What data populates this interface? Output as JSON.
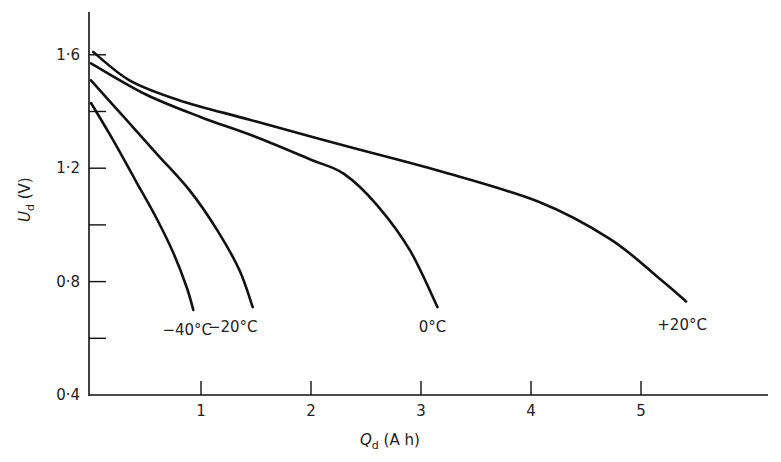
{
  "chart_data": {
    "type": "line",
    "title": "",
    "xlabel": "Q_d (A h)",
    "ylabel": "U_d (V)",
    "xlim": [
      0,
      6.2
    ],
    "ylim": [
      0.4,
      1.75
    ],
    "x_ticks": [
      1,
      2,
      3,
      4,
      5
    ],
    "x_tick_labels": [
      "1",
      "2",
      "3",
      "4",
      "5"
    ],
    "y_ticks": [
      0.4,
      0.6,
      0.8,
      1.0,
      1.2,
      1.4,
      1.6
    ],
    "y_tick_labels": [
      "0·4",
      "",
      "0·8",
      "",
      "1·2",
      "",
      "1·6"
    ],
    "grid": false,
    "legend": "inline labels at curve ends",
    "series": [
      {
        "name": "-40°C",
        "label": "−40°C",
        "points": [
          [
            0.0,
            1.43
          ],
          [
            0.2,
            1.3
          ],
          [
            0.4,
            1.16
          ],
          [
            0.6,
            1.02
          ],
          [
            0.75,
            0.9
          ],
          [
            0.87,
            0.78
          ],
          [
            0.93,
            0.7
          ]
        ]
      },
      {
        "name": "-20°C",
        "label": "−20°C",
        "points": [
          [
            0.0,
            1.51
          ],
          [
            0.3,
            1.38
          ],
          [
            0.6,
            1.25
          ],
          [
            0.9,
            1.12
          ],
          [
            1.15,
            0.98
          ],
          [
            1.35,
            0.84
          ],
          [
            1.47,
            0.71
          ]
        ]
      },
      {
        "name": "0°C",
        "label": "0°C",
        "points": [
          [
            0.0,
            1.57
          ],
          [
            0.5,
            1.46
          ],
          [
            1.0,
            1.38
          ],
          [
            1.5,
            1.31
          ],
          [
            2.0,
            1.23
          ],
          [
            2.3,
            1.18
          ],
          [
            2.6,
            1.07
          ],
          [
            2.9,
            0.91
          ],
          [
            3.15,
            0.71
          ]
        ]
      },
      {
        "name": "+20°C",
        "label": "+20°C",
        "points": [
          [
            0.02,
            1.61
          ],
          [
            0.35,
            1.51
          ],
          [
            0.8,
            1.44
          ],
          [
            1.45,
            1.37
          ],
          [
            2.3,
            1.28
          ],
          [
            3.17,
            1.19
          ],
          [
            4.08,
            1.08
          ],
          [
            4.72,
            0.95
          ],
          [
            5.17,
            0.81
          ],
          [
            5.41,
            0.73
          ]
        ]
      }
    ]
  },
  "axes": {
    "x_title_main": "Q",
    "x_title_sub": "d",
    "x_title_unit": " (A h)",
    "y_title_main": "U",
    "y_title_sub": "d",
    "y_title_unit": " (V)"
  }
}
